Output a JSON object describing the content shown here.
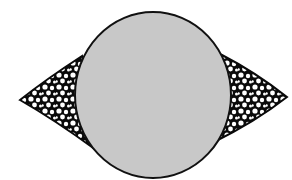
{
  "diagram": {
    "canvas": {
      "width": 292,
      "height": 180,
      "background": "#ffffff"
    },
    "colors": {
      "circle_fill": "#c8c8c8",
      "outline": "#111111",
      "wing_fill": "#0a0a0a",
      "speckle": "#ffffff"
    },
    "circle": {
      "cx": 153,
      "cy": 95,
      "rx": 78,
      "ry": 83
    },
    "left_wing": {
      "tip": [
        20,
        100
      ],
      "top": [
        80,
        56
      ],
      "bottom": [
        88,
        150
      ]
    },
    "right_wing": {
      "tip": [
        287,
        97
      ],
      "top": [
        222,
        55
      ],
      "bottom": [
        222,
        140
      ]
    },
    "icons": [
      "circle-shape",
      "left-wing-shape",
      "right-wing-shape"
    ]
  }
}
